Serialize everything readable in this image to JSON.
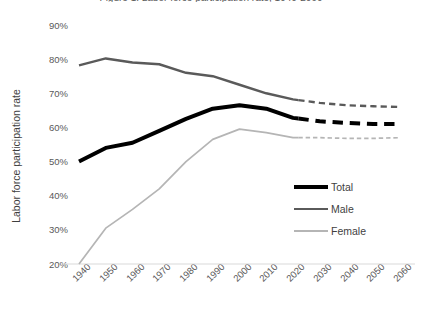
{
  "chart_data": {
    "type": "line",
    "title": "Figure 1. Labor force participation rate, 1940-2060",
    "xlabel": "",
    "ylabel": "Labor force participation rate",
    "x": [
      1940,
      1950,
      1960,
      1970,
      1980,
      1990,
      2000,
      2010,
      2020,
      2030,
      2040,
      2050,
      2060
    ],
    "xticklabels": [
      "1940",
      "1950",
      "1960",
      "1970",
      "1980",
      "1990",
      "2000",
      "2010",
      "2020",
      "2030",
      "2040",
      "2050",
      "2060"
    ],
    "yticklabels": [
      "90%",
      "80%",
      "70%",
      "60%",
      "50%",
      "40%",
      "30%",
      "20%"
    ],
    "ylim": [
      20,
      90
    ],
    "ytick_step": 10,
    "xlim": [
      1940,
      2060
    ],
    "grid": false,
    "legend_position": "center-right",
    "forecast_start": 2022,
    "forecast_style": "dashed",
    "series": [
      {
        "name": "Total",
        "color": "#000000",
        "width": 4.0,
        "values": [
          50,
          54,
          55.5,
          59,
          62.5,
          65.5,
          66.5,
          65.5,
          62.8,
          61.8,
          61.3,
          61.0,
          61.0
        ]
      },
      {
        "name": "Male",
        "color": "#5a5a5a",
        "width": 2.4,
        "values": [
          78.2,
          80.2,
          79.0,
          78.5,
          76.0,
          75.0,
          72.5,
          70.0,
          68.2,
          67.2,
          66.5,
          66.2,
          66.0
        ]
      },
      {
        "name": "Female",
        "color": "#b5b5b5",
        "width": 1.7,
        "values": [
          20.0,
          30.5,
          36.0,
          42.0,
          50.0,
          56.5,
          59.5,
          58.5,
          57.0,
          57.0,
          56.8,
          56.8,
          57.0
        ]
      }
    ]
  },
  "legend": {
    "items": [
      {
        "label": "Total"
      },
      {
        "label": "Male"
      },
      {
        "label": "Female"
      }
    ]
  },
  "axes": {
    "y_title": "Labor force participation rate"
  },
  "colors": {
    "total": "#000000",
    "male": "#5a5a5a",
    "female": "#b5b5b5",
    "text": "#595959",
    "background": "#ffffff"
  }
}
